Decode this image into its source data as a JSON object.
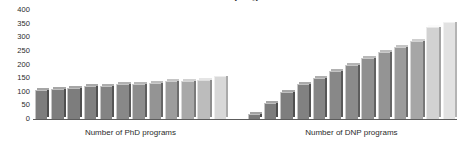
{
  "chart_data": {
    "type": "bar",
    "title": "Number of programs",
    "xlabel": "",
    "ylabel": "",
    "ylim": [
      0,
      400
    ],
    "yticks": [
      0,
      50,
      100,
      150,
      200,
      250,
      300,
      350,
      400
    ],
    "ytick_labels": [
      "0",
      "50",
      "100",
      "150",
      "200",
      "250",
      "300",
      "350",
      "400"
    ],
    "grid": false,
    "legend": "none",
    "groups": [
      {
        "name": "Number of PhD programs",
        "label": "Number of PhD programs",
        "values": [
          105,
          110,
          115,
          120,
          122,
          127,
          130,
          132,
          140,
          138,
          142,
          158
        ],
        "colors": [
          "#7d7d7d",
          "#7d7d7d",
          "#7d7d7d",
          "#808080",
          "#848484",
          "#888888",
          "#8d8d8d",
          "#949494",
          "#9c9c9c",
          "#a8a8a8",
          "#bcbcbc",
          "#d8d8d8"
        ]
      },
      {
        "name": "Number of DNP programs",
        "label": "Number of DNP programs",
        "values": [
          20,
          60,
          100,
          128,
          150,
          175,
          200,
          225,
          245,
          265,
          285,
          338,
          355
        ],
        "colors": [
          "#7a7a7a",
          "#7c7c7c",
          "#7e7e7e",
          "#818181",
          "#858585",
          "#888888",
          "#8b8b8b",
          "#8f8f8f",
          "#949494",
          "#9b9b9b",
          "#a6a6a6",
          "#d2d2d2",
          "#e2e2e2"
        ]
      }
    ]
  },
  "axis": {
    "tick_400": "400",
    "tick_350": "350",
    "tick_300": "300",
    "tick_250": "250",
    "tick_200": "200",
    "tick_150": "150",
    "tick_100": "100",
    "tick_50": "50",
    "tick_0": "0"
  },
  "colors": {
    "baseline": "#5c5c5c",
    "text": "#2b2b2b",
    "background": "#ffffff"
  }
}
